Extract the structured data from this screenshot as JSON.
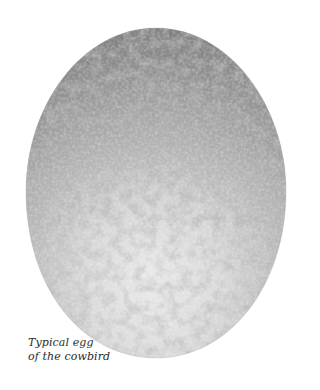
{
  "illustration": {
    "subject": "cowbird egg",
    "style": "stippled grayscale speckled egg",
    "colors": {
      "background": "#ffffff",
      "egg_top": "#8e8e8e",
      "egg_mid": "#c4c4c4",
      "egg_bottom": "#e4e4e4",
      "speckle_dark": "#707070",
      "speckle_light": "#f0f0f0"
    }
  },
  "caption": {
    "line1": "Typical egg",
    "line2": "of the cowbird"
  }
}
